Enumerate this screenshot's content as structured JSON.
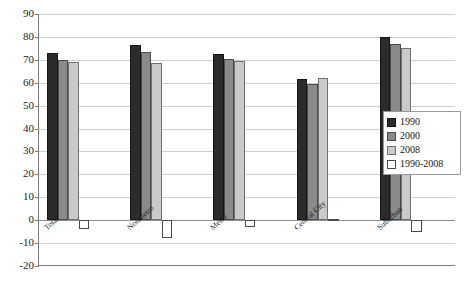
{
  "chart_data": {
    "type": "bar",
    "title": "",
    "subtitle": "",
    "xlabel": "",
    "ylabel": "",
    "ylim": [
      -20,
      90
    ],
    "ytick_step": 10,
    "yticks": [
      90,
      80,
      70,
      60,
      50,
      40,
      30,
      20,
      10,
      0,
      -10,
      -20
    ],
    "ytick_labels": [
      "90",
      "80",
      "70",
      "60",
      "50",
      "40",
      "30",
      "20",
      "10",
      "0",
      "-10",
      "-20"
    ],
    "grid": true,
    "grid_axis": "y",
    "legend_position": "right",
    "categories": [
      "Total",
      "Nonmetro",
      "Metro",
      "Central City",
      "Suburban"
    ],
    "series": [
      {
        "name": "1990",
        "color": "#2b2b2b",
        "values": [
          73,
          76.5,
          72.5,
          61.5,
          80
        ]
      },
      {
        "name": "2000",
        "color": "#8a8a8a",
        "values": [
          70,
          73.5,
          70.5,
          59.5,
          77
        ]
      },
      {
        "name": "2008",
        "color": "#cacaca",
        "values": [
          69,
          68.5,
          69.5,
          62,
          75
        ]
      },
      {
        "name": "1990-2008",
        "color": "#ffffff",
        "values": [
          -4,
          -8,
          -3,
          0.5,
          -5
        ]
      }
    ],
    "annotations": []
  },
  "legend": {
    "entries": [
      {
        "label": "1990"
      },
      {
        "label": "2000"
      },
      {
        "label": "2008"
      },
      {
        "label": "1990-2008"
      }
    ]
  }
}
